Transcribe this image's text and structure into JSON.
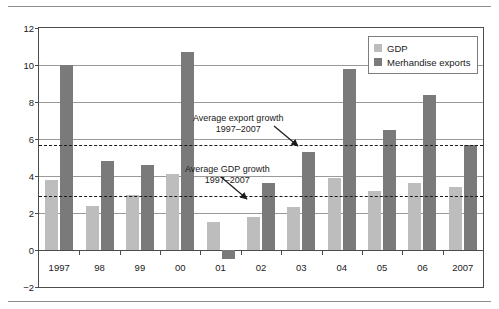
{
  "chart_data": {
    "type": "bar",
    "title": "",
    "subtitle": "",
    "xlabel": "",
    "ylabel": "",
    "categories": [
      "1997",
      "98",
      "99",
      "00",
      "01",
      "02",
      "03",
      "04",
      "05",
      "06",
      "2007"
    ],
    "series": [
      {
        "name": "GDP",
        "color": "#bdbdbd",
        "values": [
          3.8,
          2.4,
          3.0,
          4.1,
          1.5,
          1.8,
          2.3,
          3.9,
          3.2,
          3.6,
          3.4
        ]
      },
      {
        "name": "Merhandise exports",
        "color": "#7a7a7a",
        "values": [
          10.0,
          4.8,
          4.6,
          10.7,
          -0.5,
          3.6,
          5.3,
          9.8,
          6.5,
          8.4,
          5.7
        ]
      }
    ],
    "ylim": [
      -2,
      12
    ],
    "yticks": [
      12,
      10,
      8,
      6,
      4,
      2,
      0,
      -2
    ],
    "ytick_labels": [
      "12",
      "10",
      "8",
      "6",
      "4",
      "2",
      "0",
      "−2"
    ],
    "grid": true,
    "legend_position": "top-right",
    "reference_lines": [
      {
        "name": "average-export-growth",
        "value": 5.7,
        "style": "dashed",
        "label": "Average export growth\n1997–2007"
      },
      {
        "name": "average-gdp-growth",
        "value": 2.9,
        "style": "dashed",
        "label": "Average GDP growth\n1997–2007"
      }
    ]
  },
  "legend": {
    "items": [
      {
        "label": "GDP"
      },
      {
        "label": "Merhandise exports"
      }
    ]
  },
  "annotations": [
    {
      "line1": "Average export growth",
      "line2": "1997–2007"
    },
    {
      "line1": "Average GDP growth",
      "line2": "1997–2007"
    }
  ],
  "axis": {
    "y_labels": [
      "12",
      "10",
      "8",
      "6",
      "4",
      "2",
      "0",
      "−2"
    ],
    "x_labels": [
      "1997",
      "98",
      "99",
      "00",
      "01",
      "02",
      "03",
      "04",
      "05",
      "06",
      "2007"
    ]
  }
}
